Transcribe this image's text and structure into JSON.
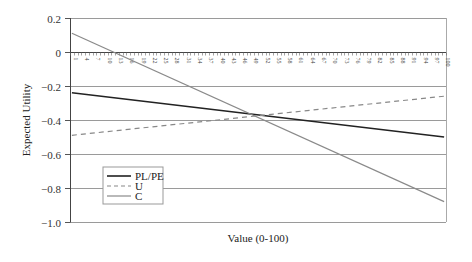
{
  "chart_data": {
    "type": "line",
    "title": "",
    "xlabel": "Value (0-100)",
    "ylabel": "Expected Utility",
    "x_range": [
      1,
      100
    ],
    "ylim": [
      -1.0,
      0.2
    ],
    "y_ticks": [
      0.2,
      0,
      -0.2,
      -0.4,
      -0.6,
      -0.8,
      -1.0
    ],
    "y_tick_labels": [
      "0.2",
      "0",
      "−0.2",
      "−0.4",
      "−0.6",
      "−0.8",
      "−1.0"
    ],
    "x_tick_labels": [
      "1",
      "4",
      "7",
      "10",
      "13",
      "16",
      "19",
      "22",
      "25",
      "28",
      "31",
      "34",
      "37",
      "40",
      "43",
      "46",
      "49",
      "52",
      "55",
      "58",
      "61",
      "64",
      "67",
      "70",
      "73",
      "76",
      "79",
      "82",
      "85",
      "88",
      "91",
      "94",
      "97",
      "100"
    ],
    "grid": "horizontal",
    "legend_position": "lower-left inside",
    "series": [
      {
        "name": "PL/PE",
        "style": "solid",
        "color": "#222222",
        "x": [
          1,
          100
        ],
        "values": [
          -0.24,
          -0.5
        ]
      },
      {
        "name": "U",
        "style": "dashed",
        "color": "#888888",
        "x": [
          1,
          100
        ],
        "values": [
          -0.49,
          -0.26
        ]
      },
      {
        "name": "C",
        "style": "solid",
        "color": "#8a8a8a",
        "x": [
          1,
          100
        ],
        "values": [
          0.11,
          -0.88
        ]
      }
    ],
    "annotations": []
  },
  "legend": {
    "items": [
      {
        "label": "PL/PE"
      },
      {
        "label": "U"
      },
      {
        "label": "C"
      }
    ]
  },
  "axes": {
    "x_title": "Value (0-100)",
    "y_title": "Expected Utility"
  }
}
